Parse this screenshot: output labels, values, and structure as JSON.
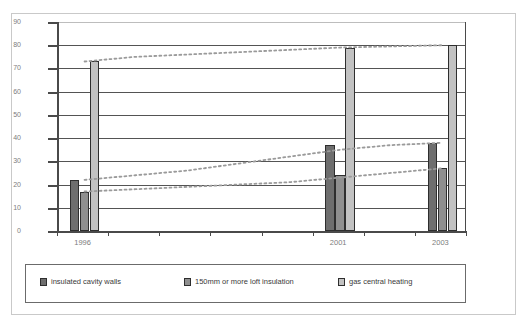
{
  "chart_data": {
    "type": "bar",
    "title": "",
    "subtitle": "",
    "xlabel": "",
    "ylabel": "",
    "ylim": [
      0,
      90
    ],
    "ytick_step": 10,
    "yticks": [
      "0",
      "10",
      "20",
      "30",
      "40",
      "50",
      "60",
      "70",
      "80",
      "90"
    ],
    "grid": true,
    "legend_position": "bottom",
    "x": [
      1996,
      1997,
      1998,
      1999,
      2000,
      2001,
      2002,
      2003
    ],
    "categories": [
      "1996",
      "2001",
      "2003"
    ],
    "xtick_labels": [
      "1996",
      "",
      "",
      "",
      "",
      "2001",
      "",
      "2003"
    ],
    "series": [
      {
        "name": "insulated cavity walls",
        "color": "#6e6e6e",
        "values": [
          22,
          37,
          38
        ],
        "trend": [
          22,
          24,
          26,
          29,
          32,
          35,
          37,
          38
        ]
      },
      {
        "name": "150mm or more loft insulation",
        "color": "#8f8f8f",
        "values": [
          17,
          24,
          27
        ],
        "trend": [
          17,
          18,
          19,
          20,
          21,
          23,
          25,
          27
        ]
      },
      {
        "name": "gas central heating",
        "color": "#c2c2c2",
        "values": [
          73,
          79,
          80
        ],
        "trend": [
          73,
          75,
          76,
          77,
          78,
          79,
          79.5,
          80
        ]
      }
    ],
    "trendline_style": "dotted",
    "trendline_color": "#9a9a9a"
  },
  "legend": {
    "items": [
      {
        "label": "insulated cavity walls",
        "swatch": "s0"
      },
      {
        "label": "150mm or more loft insulation",
        "swatch": "s1"
      },
      {
        "label": "gas central heating",
        "swatch": "s2"
      }
    ]
  }
}
